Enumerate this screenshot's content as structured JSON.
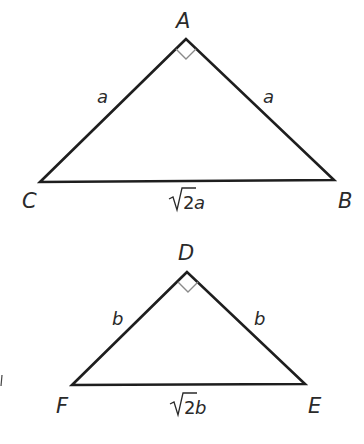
{
  "diagram": {
    "triangles": [
      {
        "id": "ABC",
        "vertices": {
          "top": "A",
          "left": "C",
          "right": "B"
        },
        "right_angle_at": "A",
        "sides": {
          "left_leg": "a",
          "right_leg": "a",
          "hypotenuse_coef": "2",
          "hypotenuse_var": "a"
        }
      },
      {
        "id": "DEF",
        "vertices": {
          "top": "D",
          "left": "F",
          "right": "E"
        },
        "right_angle_at": "D",
        "sides": {
          "left_leg": "b",
          "right_leg": "b",
          "hypotenuse_coef": "2",
          "hypotenuse_var": "b"
        }
      }
    ],
    "colors": {
      "edge": "#1e1e1e",
      "right_angle_mark": "#8a8a8a",
      "text": "#2a2a2a"
    }
  }
}
